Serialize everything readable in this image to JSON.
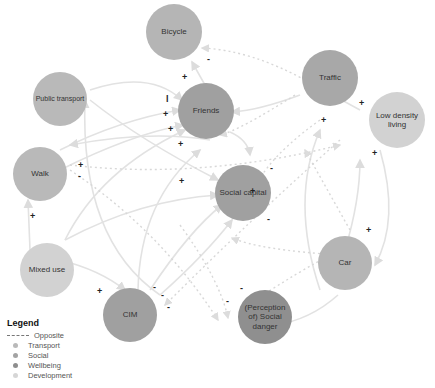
{
  "legend": {
    "title": "Legend",
    "items": [
      {
        "label": "Opposite",
        "kind": "dashed-line"
      },
      {
        "label": "Transport",
        "color": "#b9b9b9"
      },
      {
        "label": "Social",
        "color": "#a3a3a3"
      },
      {
        "label": "Wellbeing",
        "color": "#8e8e8e"
      },
      {
        "label": "Development",
        "color": "#d6d6d6"
      }
    ]
  },
  "nodes": {
    "bicycle": {
      "label": "Bicycle",
      "category": "Transport"
    },
    "public_transport": {
      "label": "Public transport",
      "category": "Transport"
    },
    "friends": {
      "label": "Friends",
      "category": "Social"
    },
    "traffic": {
      "label": "Traffic",
      "category": "Transport"
    },
    "low_density": {
      "label": "Low density living",
      "category": "Development"
    },
    "walk": {
      "label": "Walk",
      "category": "Transport"
    },
    "social_capital": {
      "label": "Social capital",
      "category": "Social"
    },
    "mixed_use": {
      "label": "Mixed use",
      "category": "Development"
    },
    "car": {
      "label": "Car",
      "category": "Transport"
    },
    "cim": {
      "label": "CIM",
      "category": "Social"
    },
    "social_danger": {
      "label": "(Perception of) Social danger",
      "category": "Wellbeing"
    }
  },
  "signs": [
    "+",
    "-",
    "l",
    "+",
    "+",
    "+",
    "+",
    "+",
    "-",
    "+",
    "+",
    "+",
    "-",
    "-",
    "+",
    "+",
    "+",
    "-",
    "-",
    "-",
    "-",
    "-",
    "+"
  ]
}
